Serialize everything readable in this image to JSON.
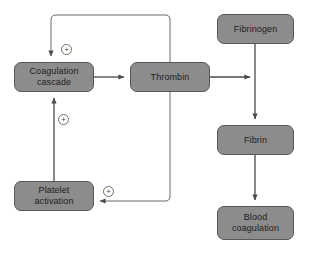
{
  "diagram": {
    "colors": {
      "node_fill": "#8c8c8c",
      "node_stroke": "#58585a",
      "node_text": "#1c1c1c",
      "line": "#4a4a4c",
      "badge_stroke": "#6e6e70",
      "background": "#ffffff"
    },
    "nodes": [
      {
        "id": "coagulation-cascade",
        "label": "Coagulation\ncascade",
        "x": 14,
        "y": 62,
        "width": 80,
        "height": 30
      },
      {
        "id": "thrombin",
        "label": "Thrombin",
        "x": 130,
        "y": 62,
        "width": 80,
        "height": 30
      },
      {
        "id": "platelet-activation",
        "label": "Platelet\nactivation",
        "x": 14,
        "y": 181,
        "width": 80,
        "height": 30
      },
      {
        "id": "fibrinogen",
        "label": "Fibrinogen",
        "x": 217,
        "y": 14,
        "width": 77,
        "height": 30
      },
      {
        "id": "fibrin",
        "label": "Fibrin",
        "x": 217,
        "y": 125,
        "width": 77,
        "height": 30
      },
      {
        "id": "blood-coagulation",
        "label": "Blood\ncoagulation",
        "x": 217,
        "y": 206,
        "width": 77,
        "height": 34
      }
    ],
    "badges": [
      {
        "id": "plus-cascade-top",
        "symbol": "+",
        "x": 61,
        "y": 44,
        "meaning": "positive feedback on coagulation cascade from thrombin"
      },
      {
        "id": "plus-cascade-bottom",
        "symbol": "+",
        "x": 58,
        "y": 114,
        "meaning": "positive effect on coagulation cascade from platelet activation"
      },
      {
        "id": "plus-platelet",
        "symbol": "+",
        "x": 103,
        "y": 186,
        "meaning": "positive effect on platelet activation from thrombin"
      }
    ],
    "edges": [
      {
        "id": "cascade-to-thrombin",
        "from": "coagulation-cascade",
        "to": "thrombin",
        "sign": ""
      },
      {
        "id": "thrombin-to-cascade-feedback",
        "from": "thrombin",
        "to": "coagulation-cascade",
        "sign": "+"
      },
      {
        "id": "thrombin-to-platelet-feedback",
        "from": "thrombin",
        "to": "platelet-activation",
        "sign": "+"
      },
      {
        "id": "platelet-to-cascade",
        "from": "platelet-activation",
        "to": "coagulation-cascade",
        "sign": "+"
      },
      {
        "id": "thrombin-catalyses-fibrinogen",
        "from": "thrombin",
        "to": "fibrinogen-fibrin-conversion",
        "sign": ""
      },
      {
        "id": "fibrinogen-to-fibrin",
        "from": "fibrinogen",
        "to": "fibrin",
        "sign": ""
      },
      {
        "id": "fibrin-to-blood-coagulation",
        "from": "fibrin",
        "to": "blood-coagulation",
        "sign": ""
      }
    ]
  }
}
